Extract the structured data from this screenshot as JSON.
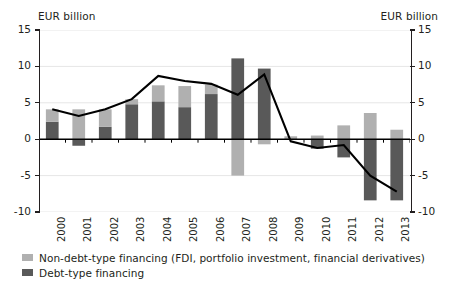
{
  "chart_data": {
    "type": "bar",
    "title": "",
    "subtitle": "",
    "xlabel": "",
    "ylabel": "EUR billion",
    "y_unit_left": "EUR billion",
    "y_unit_right": "EUR billion",
    "ylim": [
      -10,
      15
    ],
    "yticks": [
      15,
      10,
      5,
      0,
      -5,
      -10
    ],
    "ytick_labels": [
      "15",
      "10",
      "5",
      "0",
      "-5",
      "-10"
    ],
    "grid": true,
    "legend_position": "bottom-left",
    "stacked": true,
    "categories": [
      "2000",
      "2001",
      "2002",
      "2003",
      "2004",
      "2005",
      "2006",
      "2007",
      "2008",
      "2009",
      "2010",
      "2011",
      "2012",
      "2013"
    ],
    "series": [
      {
        "name": "Non-debt-type financing (FDI, portfolio investment, financial derivatives)",
        "type": "bar",
        "color": "#b0b0b0",
        "values": [
          1.7,
          4.1,
          2.4,
          0.7,
          2.2,
          2.9,
          1.3,
          -5.0,
          -0.7,
          0.4,
          0.5,
          1.9,
          3.6,
          1.3
        ]
      },
      {
        "name": "Debt-type financing",
        "type": "bar",
        "color": "#595959",
        "values": [
          2.4,
          -0.9,
          1.7,
          4.8,
          5.2,
          4.4,
          6.2,
          11.1,
          9.7,
          0.0,
          -1.3,
          -2.5,
          -8.4,
          -8.4
        ]
      },
      {
        "name": "Total",
        "type": "line",
        "color": "#000000",
        "values": [
          4.1,
          3.2,
          4.1,
          5.5,
          8.7,
          8.0,
          7.6,
          6.1,
          8.9,
          -0.3,
          -1.2,
          -0.8,
          -5.0,
          -7.2
        ]
      }
    ]
  },
  "legend": {
    "items": [
      {
        "label": "Non-debt-type financing (FDI, portfolio investment, financial derivatives)",
        "color": "#b0b0b0"
      },
      {
        "label": "Debt-type financing",
        "color": "#595959"
      }
    ]
  },
  "colors": {
    "non_debt": "#b0b0b0",
    "debt": "#595959",
    "line": "#000000",
    "axis": "#231f20",
    "grid": "#e6e6e6",
    "background": "#ffffff"
  }
}
